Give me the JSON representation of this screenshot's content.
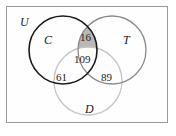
{
  "figure": {
    "type": "venn-diagram-3-set",
    "universe_label": "U",
    "sets": [
      {
        "id": "C",
        "label": "C",
        "stroke_color": "#1a1a1a"
      },
      {
        "id": "T",
        "label": "T",
        "stroke_color": "#8a8a8a"
      },
      {
        "id": "D",
        "label": "D",
        "stroke_color": "#c4c4c4"
      }
    ],
    "shaded_region": {
      "name": "C-and-T-not-D",
      "fill_color": "#b8b8b8",
      "value": "16"
    },
    "region_counts": [
      {
        "name": "C-and-T-only",
        "value": "16"
      },
      {
        "name": "C-and-T-and-D",
        "value": "109"
      },
      {
        "name": "C-and-D-only",
        "value": "61"
      },
      {
        "name": "T-and-D-only",
        "value": "89"
      }
    ],
    "border_color": "#9a9a9a",
    "background_color": "#ffffff"
  }
}
